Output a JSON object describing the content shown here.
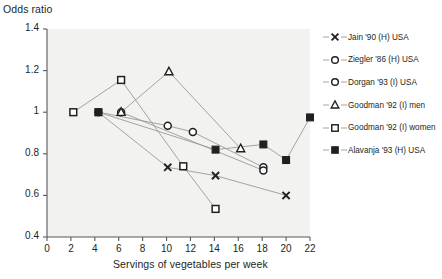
{
  "chart_data": {
    "type": "line",
    "title": "",
    "ylabel": "Odds ratio",
    "xlabel": "Servings of vegetables per week",
    "xlim": [
      0,
      22
    ],
    "ylim": [
      0.4,
      1.4
    ],
    "xticks": [
      "0",
      "2",
      "4",
      "6",
      "8",
      "10",
      "12",
      "14",
      "16",
      "18",
      "20",
      "22"
    ],
    "yticks": [
      "0.4",
      "0.6",
      "0.8",
      "1",
      "1.2",
      "1.4"
    ],
    "grid": false,
    "legend_position": "right",
    "series": [
      {
        "name": "Jain '90 (H) USA",
        "marker": "x",
        "color": "#231f20",
        "points": [
          {
            "x": 4.3,
            "y": 1.0
          },
          {
            "x": 10.1,
            "y": 0.735
          },
          {
            "x": 14.1,
            "y": 0.695
          },
          {
            "x": 20.0,
            "y": 0.6
          }
        ]
      },
      {
        "name": "Ziegler '86 (H) USA",
        "marker": "circle-open",
        "color": "#231f20",
        "points": [
          {
            "x": 4.3,
            "y": 1.0
          },
          {
            "x": 10.1,
            "y": 0.935
          },
          {
            "x": 12.2,
            "y": 0.905
          },
          {
            "x": 18.1,
            "y": 0.735
          }
        ]
      },
      {
        "name": "Dorgan '93 (I) USA",
        "marker": "circle-open",
        "color": "#231f20",
        "points": [
          {
            "x": 6.2,
            "y": 1.0
          },
          {
            "x": 18.1,
            "y": 0.72
          }
        ]
      },
      {
        "name": "Goodman '92 (I) men",
        "marker": "triangle-open",
        "color": "#231f20",
        "points": [
          {
            "x": 6.2,
            "y": 1.0
          },
          {
            "x": 10.2,
            "y": 1.195
          },
          {
            "x": 16.2,
            "y": 0.825
          }
        ]
      },
      {
        "name": "Goodman '92 (I) women",
        "marker": "square-open",
        "color": "#231f20",
        "points": [
          {
            "x": 2.2,
            "y": 1.0
          },
          {
            "x": 6.2,
            "y": 1.155
          },
          {
            "x": 11.4,
            "y": 0.74
          },
          {
            "x": 14.1,
            "y": 0.535
          }
        ]
      },
      {
        "name": "Alavanja '93 (H) USA",
        "marker": "square-filled",
        "color": "#231f20",
        "points": [
          {
            "x": 4.3,
            "y": 1.0
          },
          {
            "x": 14.1,
            "y": 0.82
          },
          {
            "x": 18.1,
            "y": 0.845
          },
          {
            "x": 20.0,
            "y": 0.77
          },
          {
            "x": 22.0,
            "y": 0.975
          }
        ]
      }
    ]
  },
  "legend": {
    "items": [
      {
        "label": "Jain '90 (H) USA",
        "marker": "x-marker-icon"
      },
      {
        "label": "Ziegler '86 (H) USA",
        "marker": "circle-open-marker-icon"
      },
      {
        "label": "Dorgan '93 (I) USA",
        "marker": "circle-open-marker-icon"
      },
      {
        "label": "Goodman '92 (I) men",
        "marker": "triangle-open-marker-icon"
      },
      {
        "label": "Goodman '92 (I) women",
        "marker": "square-open-marker-icon"
      },
      {
        "label": "Alavanja '93 (H) USA",
        "marker": "square-filled-marker-icon"
      }
    ]
  },
  "colors": {
    "plot_background": "#f2f2f0",
    "axis": "#58595b",
    "marker": "#231f20",
    "line": "#9a9a9a"
  }
}
